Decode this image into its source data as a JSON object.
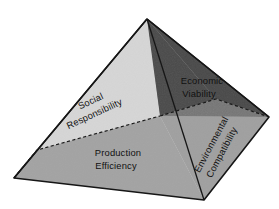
{
  "diagram": {
    "type": "pyramid",
    "background_color": "#ffffff",
    "canvas": {
      "width": 279,
      "height": 209
    },
    "geometry": {
      "apex": [
        147,
        19
      ],
      "left_vertex": [
        14,
        178
      ],
      "right_vertex": [
        269,
        117
      ],
      "front_vertex": [
        204,
        200
      ],
      "tier_left": [
        37,
        150
      ],
      "tier_center": [
        160,
        116
      ],
      "tier_right": [
        216,
        99
      ],
      "center_mid": [
        178,
        138
      ],
      "outline_color": "#1a1a1a",
      "dashed_color": "#1a1a1a"
    },
    "faces": [
      {
        "id": "upper-left",
        "name": "social-responsibility-face",
        "fill": "#d6d6d6",
        "label_lines": [
          "Social",
          "Responsibility"
        ],
        "rotation_deg": -25,
        "label_x": 92,
        "label_y": 106
      },
      {
        "id": "upper-right",
        "name": "economic-viability-face",
        "fill": "#4a4a4a",
        "label_lines": [
          "Economic",
          "Viability"
        ],
        "rotation_deg": 0,
        "label_x": 200,
        "label_y": 88
      },
      {
        "id": "lower-front",
        "name": "production-efficiency-face",
        "fill": "#a3a3a3",
        "label_lines": [
          "Production",
          "Efficiency"
        ],
        "rotation_deg": 0,
        "label_x": 118,
        "label_y": 158
      },
      {
        "id": "lower-right",
        "name": "environmental-compatibility-face",
        "fill": "#a3a3a3",
        "label_lines": [
          "Environmental",
          "Compatibility"
        ],
        "rotation_deg": -62,
        "label_x": 219,
        "label_y": 142
      }
    ],
    "labels": {
      "social_responsibility_line1": "Social",
      "social_responsibility_line2": "Responsibility",
      "economic_viability_line1": "Economic",
      "economic_viability_line2": "Viability",
      "production_efficiency_line1": "Production",
      "production_efficiency_line2": "Efficiency",
      "environmental_compatibility_line1": "Environmental",
      "environmental_compatibility_line2": "Compatibility"
    },
    "label_colors": {
      "on_light": "#111111",
      "on_dark": "#0d0d0d"
    }
  }
}
